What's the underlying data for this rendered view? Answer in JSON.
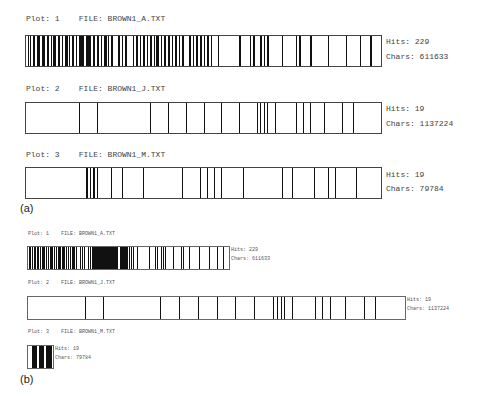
{
  "panels": {
    "a": {
      "label": "(a)",
      "plots": [
        {
          "title": "Plot: 1    FILE: BROWN1_A.TXT",
          "hits": "Hits: 229",
          "chars": "Chars: 611633"
        },
        {
          "title": "Plot: 2    FILE: BROWN1_J.TXT",
          "hits": "Hits: 19",
          "chars": "Chars: 1137224"
        },
        {
          "title": "Plot: 3    FILE: BROWN1_M.TXT",
          "hits": "Hits: 19",
          "chars": "Chars: 79784"
        }
      ]
    },
    "b": {
      "label": "(b)",
      "plots": [
        {
          "title": "Plot: 1    FILE: BROWN1_A.TXT",
          "hits": "Hits: 229",
          "chars": "Chars: 611633"
        },
        {
          "title": "Plot: 2    FILE: BROWN1_J.TXT",
          "hits": "Hits: 19",
          "chars": "Chars: 1137224"
        },
        {
          "title": "Plot: 3    FILE: BROWN1_M.TXT",
          "hits": "Hits: 19",
          "chars": "Chars: 79784"
        }
      ]
    }
  },
  "chart_data": [
    {
      "type": "dispersion",
      "title": "(a) Concordance dispersion plots, normalized widths",
      "series": [
        {
          "name": "BROWN1_A.TXT",
          "hits": 229,
          "chars": 611633,
          "positions": [
            0.005,
            0.01,
            0.02,
            0.03,
            0.035,
            0.045,
            0.05,
            0.06,
            0.07,
            0.075,
            0.08,
            0.09,
            0.1,
            0.11,
            0.115,
            0.12,
            0.13,
            0.14,
            0.15,
            0.155,
            0.16,
            0.17,
            0.175,
            0.18,
            0.19,
            0.2,
            0.21,
            0.22,
            0.225,
            0.23,
            0.24,
            0.26,
            0.27,
            0.28,
            0.3,
            0.31,
            0.32,
            0.33,
            0.34,
            0.35,
            0.36,
            0.365,
            0.37,
            0.38,
            0.39,
            0.4,
            0.41,
            0.42,
            0.43,
            0.44,
            0.46,
            0.47,
            0.48,
            0.49,
            0.5,
            0.51,
            0.52,
            0.54,
            0.6,
            0.63,
            0.64,
            0.66,
            0.67,
            0.68,
            0.72,
            0.76,
            0.77,
            0.8,
            0.85,
            0.9,
            0.94,
            0.97
          ]
        },
        {
          "name": "BROWN1_J.TXT",
          "hits": 19,
          "chars": 1137224,
          "positions": [
            0.15,
            0.2,
            0.35,
            0.4,
            0.45,
            0.5,
            0.55,
            0.6,
            0.65,
            0.66,
            0.67,
            0.68,
            0.7,
            0.76,
            0.78,
            0.8,
            0.84,
            0.89,
            0.92
          ]
        },
        {
          "name": "BROWN1_M.TXT",
          "hits": 19,
          "chars": 79784,
          "positions": [
            0.17,
            0.18,
            0.19,
            0.2,
            0.24,
            0.27,
            0.33,
            0.44,
            0.49,
            0.51,
            0.53,
            0.55,
            0.61,
            0.72,
            0.75,
            0.81,
            0.85,
            0.87,
            0.93
          ]
        }
      ]
    },
    {
      "type": "dispersion",
      "title": "(b) Concordance dispersion plots, widths proportional to file size",
      "series": [
        {
          "name": "BROWN1_A.TXT",
          "hits": 229,
          "chars": 611633
        },
        {
          "name": "BROWN1_J.TXT",
          "hits": 19,
          "chars": 1137224
        },
        {
          "name": "BROWN1_M.TXT",
          "hits": 19,
          "chars": 79784
        }
      ]
    }
  ]
}
